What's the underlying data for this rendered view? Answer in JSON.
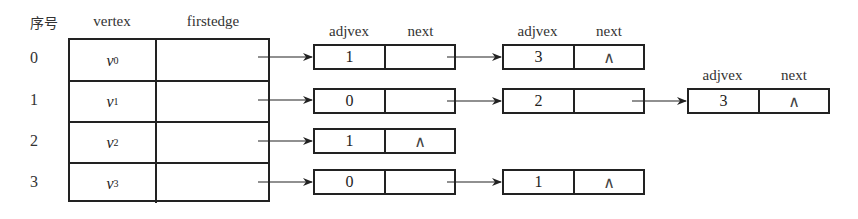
{
  "headers": {
    "index": "序号",
    "vertex": "vertex",
    "firstedge": "firstedge",
    "adjvex": "adjvex",
    "next": "next"
  },
  "vertices": [
    {
      "index": "0",
      "name": "v",
      "sub": "0"
    },
    {
      "index": "1",
      "name": "v",
      "sub": "1"
    },
    {
      "index": "2",
      "name": "v",
      "sub": "2"
    },
    {
      "index": "3",
      "name": "v",
      "sub": "3"
    }
  ],
  "null_symbol": "∧",
  "edge_lists": [
    {
      "vertex": 0,
      "nodes": [
        {
          "adjvex": "1",
          "next": ""
        },
        {
          "adjvex": "3",
          "next": "∧"
        }
      ]
    },
    {
      "vertex": 1,
      "nodes": [
        {
          "adjvex": "0",
          "next": ""
        },
        {
          "adjvex": "2",
          "next": ""
        },
        {
          "adjvex": "3",
          "next": "∧"
        }
      ]
    },
    {
      "vertex": 2,
      "nodes": [
        {
          "adjvex": "1",
          "next": "∧"
        }
      ]
    },
    {
      "vertex": 3,
      "nodes": [
        {
          "adjvex": "0",
          "next": ""
        },
        {
          "adjvex": "1",
          "next": "∧"
        }
      ]
    }
  ],
  "colors": {
    "line": "#222222",
    "background": "#ffffff"
  }
}
